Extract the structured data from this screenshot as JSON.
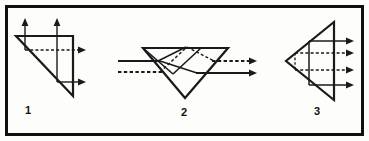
{
  "figure": {
    "background_color": "#fdfdfc",
    "border_color": "#101010",
    "border_width": 3,
    "stroke_color": "#1a1a1a",
    "width": 369,
    "height": 141,
    "panels": [
      {
        "id": "panel-1",
        "label": "1",
        "label_x": 25,
        "label_y": 114,
        "description": "Right triangle prism with two upward arrows and two rightward arrows",
        "prism": {
          "shape": "right-triangle",
          "points": "16,36 73,36 73,96"
        },
        "solid_rays": [
          {
            "name": "ray-up-left",
            "x1": 25,
            "y1": 36,
            "x2": 25,
            "y2": 20
          },
          {
            "name": "ray-up-right",
            "x1": 57,
            "y1": 36,
            "x2": 57,
            "y2": 20
          },
          {
            "name": "ray-vertical-left-internal",
            "x1": 25,
            "y1": 36,
            "x2": 25,
            "y2": 50
          },
          {
            "name": "ray-vertical-right-internal",
            "x1": 57,
            "y1": 36,
            "x2": 57,
            "y2": 82
          },
          {
            "name": "ray-right-lower",
            "x1": 57,
            "y1": 82,
            "x2": 84,
            "y2": 82
          },
          {
            "name": "ray-top-edge",
            "x1": 16,
            "y1": 36,
            "x2": 73,
            "y2": 36
          },
          {
            "name": "ray-right-edge",
            "x1": 73,
            "y1": 36,
            "x2": 73,
            "y2": 96
          }
        ],
        "dashed_rays": [
          {
            "name": "ray-dashed-horizontal",
            "x1": 25,
            "y1": 50,
            "x2": 84,
            "y2": 50
          }
        ],
        "arrow_heads": [
          {
            "name": "arrow-up-left",
            "x": 25,
            "y": 20,
            "dir": "up"
          },
          {
            "name": "arrow-up-right",
            "x": 57,
            "y": 20,
            "dir": "up"
          },
          {
            "name": "arrow-right-dashed",
            "x": 84,
            "y": 50,
            "dir": "right"
          },
          {
            "name": "arrow-right-lower",
            "x": 84,
            "y": 82,
            "dir": "right"
          }
        ]
      },
      {
        "id": "panel-2",
        "label": "2",
        "label_x": 181,
        "label_y": 116,
        "description": "Inverted triangle prism pair with horizontal rays entering left and exiting right",
        "prism": {
          "shape": "inverted-triangle",
          "points": "143,48 228,48 185,98"
        },
        "solid_rays": [
          {
            "name": "ray-in-upper",
            "x1": 118,
            "y1": 61,
            "x2": 158,
            "y2": 61
          },
          {
            "name": "ray-internal-upper",
            "x1": 158,
            "y1": 61,
            "x2": 186,
            "y2": 48
          },
          {
            "name": "ray-internal-lower-left",
            "x1": 143,
            "y1": 48,
            "x2": 171,
            "y2": 72
          },
          {
            "name": "ray-internal-lower-right",
            "x1": 171,
            "y1": 72,
            "x2": 198,
            "y2": 48
          },
          {
            "name": "ray-internal-cross",
            "x1": 158,
            "y1": 61,
            "x2": 196,
            "y2": 72
          },
          {
            "name": "ray-out-lower",
            "x1": 196,
            "y1": 72,
            "x2": 255,
            "y2": 72
          }
        ],
        "dashed_rays": [
          {
            "name": "ray-in-lower-dashed",
            "x1": 118,
            "y1": 72,
            "x2": 160,
            "y2": 72
          },
          {
            "name": "ray-internal-dashed-upper",
            "x1": 186,
            "y1": 48,
            "x2": 213,
            "y2": 61
          },
          {
            "name": "ray-internal-dashed-down",
            "x1": 160,
            "y1": 72,
            "x2": 186,
            "y2": 48
          },
          {
            "name": "ray-out-upper-dashed",
            "x1": 213,
            "y1": 61,
            "x2": 255,
            "y2": 61
          }
        ],
        "arrow_heads": [
          {
            "name": "arrow-out-upper-dashed",
            "x": 255,
            "y": 61,
            "dir": "right"
          },
          {
            "name": "arrow-out-lower",
            "x": 255,
            "y": 72,
            "dir": "right"
          }
        ]
      },
      {
        "id": "panel-3",
        "label": "3",
        "label_x": 314,
        "label_y": 115,
        "description": "Left-pointing triangle prism with four rightward exit rays",
        "prism": {
          "shape": "left-pointing-triangle",
          "points": "334,22 334,100 286,61"
        },
        "solid_rays": [
          {
            "name": "ray-upper-exit",
            "x1": 309,
            "y1": 41,
            "x2": 351,
            "y2": 41
          },
          {
            "name": "ray-lower-exit",
            "x1": 309,
            "y1": 85,
            "x2": 351,
            "y2": 85
          },
          {
            "name": "ray-vertical-internal",
            "x1": 309,
            "y1": 41,
            "x2": 309,
            "y2": 85
          },
          {
            "name": "ray-right-edge",
            "x1": 334,
            "y1": 22,
            "x2": 334,
            "y2": 100
          },
          {
            "name": "ray-upper-edge",
            "x1": 334,
            "y1": 22,
            "x2": 286,
            "y2": 61
          },
          {
            "name": "ray-lower-edge",
            "x1": 286,
            "y1": 61,
            "x2": 334,
            "y2": 100
          }
        ],
        "dashed_rays": [
          {
            "name": "ray-dashed-upper-mid",
            "x1": 295,
            "y1": 53,
            "x2": 351,
            "y2": 53
          },
          {
            "name": "ray-dashed-lower-mid",
            "x1": 295,
            "y1": 70,
            "x2": 351,
            "y2": 70
          },
          {
            "name": "ray-dashed-vertical",
            "x1": 295,
            "y1": 53,
            "x2": 295,
            "y2": 70
          }
        ],
        "arrow_heads": [
          {
            "name": "arrow-exit-1",
            "x": 351,
            "y": 41,
            "dir": "right"
          },
          {
            "name": "arrow-exit-2",
            "x": 351,
            "y": 53,
            "dir": "right"
          },
          {
            "name": "arrow-exit-3",
            "x": 351,
            "y": 70,
            "dir": "right"
          },
          {
            "name": "arrow-exit-4",
            "x": 351,
            "y": 85,
            "dir": "right"
          }
        ]
      }
    ]
  }
}
